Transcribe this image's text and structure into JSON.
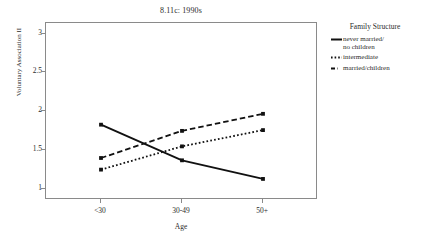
{
  "chart_data": {
    "type": "line",
    "title": "8.11c: 1990s",
    "xlabel": "Age",
    "ylabel": "Voluntary Association II",
    "categories": [
      "<30",
      "30-49",
      "50+"
    ],
    "ylim": [
      1,
      3
    ],
    "yticks": [
      "1",
      "1.5",
      "2",
      "2.5",
      "3"
    ],
    "ytick_values": [
      1,
      1.5,
      2,
      2.5,
      3
    ],
    "grid": false,
    "legend_position": "right",
    "legend_title": "Family Structure",
    "series": [
      {
        "name": "never married/\nno children",
        "style": "solid",
        "color": "#111111",
        "values": [
          1.83,
          1.37,
          1.13
        ]
      },
      {
        "name": "intermediate",
        "style": "dotted",
        "color": "#111111",
        "values": [
          1.25,
          1.55,
          1.76
        ]
      },
      {
        "name": "married/children",
        "style": "dashed",
        "color": "#111111",
        "values": [
          1.4,
          1.75,
          1.97
        ]
      }
    ]
  },
  "figure": {
    "title": "8.11c: 1990s",
    "axis_x_title": "Age",
    "axis_y_title": "Voluntary Association II",
    "xtick_labels": [
      "<30",
      "30-49",
      "50+"
    ],
    "ytick_labels": [
      "1",
      "1.5",
      "2",
      "2.5",
      "3"
    ]
  },
  "legend": {
    "title": "Family Structure",
    "items": [
      {
        "label": "never married/\nno children",
        "style": "solid"
      },
      {
        "label": "intermediate",
        "style": "dotted"
      },
      {
        "label": "married/children",
        "style": "dashed"
      }
    ]
  }
}
